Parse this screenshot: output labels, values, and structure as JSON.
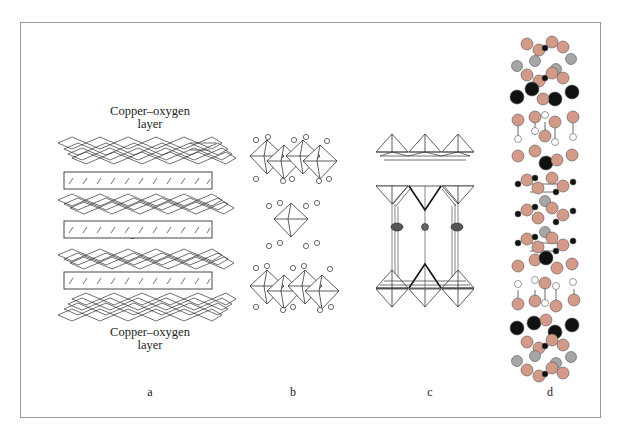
{
  "figure": {
    "panels": [
      {
        "id": "a",
        "label": "a",
        "description": "Layered schematic: copper-oxygen layers alternating with charge reservoir slabs"
      },
      {
        "id": "b",
        "label": "b",
        "description": "Octahedral layered perovskite structure with isolated atoms"
      },
      {
        "id": "c",
        "label": "c",
        "description": "Pyramidal copper-oxide layers with intercalated spherical atoms"
      },
      {
        "id": "d",
        "label": "d",
        "description": "Ball-model crystal structure with colored atoms"
      }
    ],
    "annotations": {
      "top_layer": [
        "Copper–oxygen",
        "layer"
      ],
      "reservoir": "Charge reservoir",
      "bottom_layer": [
        "Copper–oxygen",
        "layer"
      ]
    },
    "colors": {
      "frame": "#9a9a9a",
      "line": "#333333",
      "atom_copper_pink": "#d49a88",
      "atom_gray": "#a6a6a6",
      "atom_black": "#111111",
      "atom_white": "#ffffff"
    }
  }
}
